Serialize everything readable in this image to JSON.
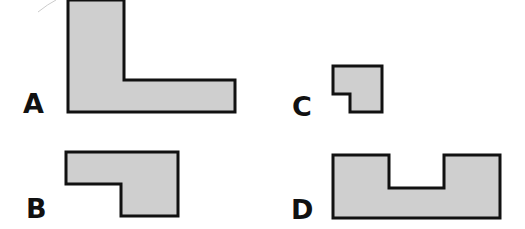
{
  "figure": {
    "fill_color": "#cfcfcf",
    "stroke_color": "#111111",
    "stroke_width": 3,
    "shapes": [
      {
        "id": "A",
        "label": "A",
        "description": "Large L-shape",
        "points": "68,0 124,0 124,80 235,80 235,112 68,112",
        "label_pos": {
          "x": 23,
          "y": 90
        }
      },
      {
        "id": "B",
        "label": "B",
        "description": "Step shape with lower-left notch",
        "points": "66,152 178,152 178,216 121,216 121,184 66,184",
        "label_pos": {
          "x": 26,
          "y": 195
        }
      },
      {
        "id": "C",
        "label": "C",
        "description": "Small square with lower-left notch",
        "points": "333,66 382,66 382,112 350,112 350,94 333,94",
        "label_pos": {
          "x": 292,
          "y": 93
        }
      },
      {
        "id": "D",
        "label": "D",
        "description": "U-shape with top notch",
        "points": "333,155 389,155 389,188 444,188 444,155 500,155 500,218 333,218",
        "label_pos": {
          "x": 291,
          "y": 196
        }
      }
    ]
  }
}
